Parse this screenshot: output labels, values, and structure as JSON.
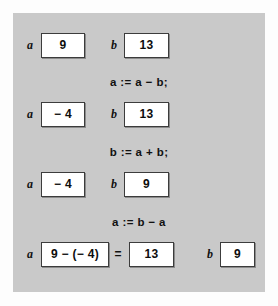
{
  "figure": {
    "panel_color": "#c9c9c9",
    "box_fill": "#ffffff",
    "box_border": "#3c3c3c",
    "text_color": "#111111"
  },
  "rows": [
    {
      "var_a": "a",
      "value_a": "9",
      "var_b": "b",
      "value_b": "13"
    },
    {
      "var_a": "a",
      "value_a": "− 4",
      "var_b": "b",
      "value_b": "13"
    },
    {
      "var_a": "a",
      "value_a": "− 4",
      "var_b": "b",
      "value_b": "9"
    }
  ],
  "statements": [
    "a := a − b;",
    "b := a + b;",
    "a := b − a"
  ],
  "final_row": {
    "var_a": "a",
    "expression": "9 − (− 4)",
    "equals": "=",
    "result": "13",
    "var_b": "b",
    "value_b": "9"
  }
}
